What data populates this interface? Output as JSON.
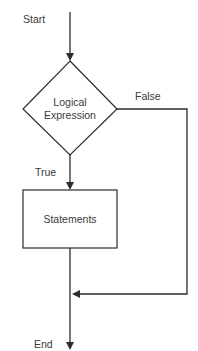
{
  "diagram": {
    "type": "flowchart",
    "nodes": {
      "start": {
        "label": "Start"
      },
      "decision": {
        "label_line1": "Logical",
        "label_line2": "Expression"
      },
      "process": {
        "label": "Statements"
      },
      "end": {
        "label": "End"
      }
    },
    "edges": {
      "true_label": "True",
      "false_label": "False"
    }
  }
}
